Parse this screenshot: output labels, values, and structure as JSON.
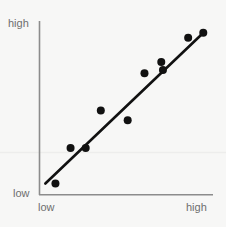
{
  "chart_data": {
    "type": "scatter",
    "title": "",
    "xlabel": "",
    "ylabel": "",
    "grid": false,
    "legend": null,
    "axis_ticks": {
      "x": [
        "low",
        "high"
      ],
      "y": [
        "low",
        "high"
      ]
    },
    "xlim": [
      0,
      100
    ],
    "ylim": [
      0,
      100
    ],
    "points": [
      {
        "x": 8,
        "y": 4
      },
      {
        "x": 17,
        "y": 26
      },
      {
        "x": 26,
        "y": 26
      },
      {
        "x": 35,
        "y": 49
      },
      {
        "x": 51,
        "y": 43
      },
      {
        "x": 61,
        "y": 72
      },
      {
        "x": 71,
        "y": 79
      },
      {
        "x": 72,
        "y": 74
      },
      {
        "x": 87,
        "y": 94
      },
      {
        "x": 96,
        "y": 97
      }
    ],
    "trend_line": {
      "type": "line",
      "x_start": 2,
      "y_start": 4,
      "x_end": 97,
      "y_end": 98,
      "color": "#111111",
      "width": 2.6
    },
    "marker": {
      "shape": "circle",
      "radius_px": 4,
      "color": "#111111"
    }
  },
  "axes": {
    "y": {
      "high_label": "high",
      "low_label": "low",
      "color": "#8c8c8c"
    },
    "x": {
      "low_label": "low",
      "high_label": "high",
      "color": "#8c8c8c"
    }
  },
  "colors": {
    "background": "#f7f7f6",
    "axis": "#8c8c8c",
    "data": "#111111",
    "label_text": "#6e6e6e",
    "faint_rule": "#ededec"
  }
}
